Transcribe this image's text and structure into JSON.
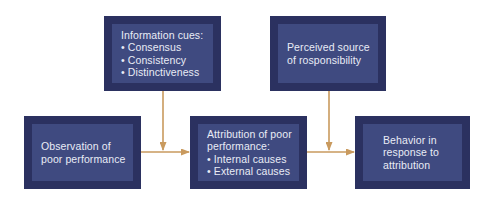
{
  "diagram": {
    "nodes": [
      {
        "id": "information-cues",
        "title": "Information cues:",
        "bullets": [
          "Consensus",
          "Consistency",
          "Distinctiveness"
        ]
      },
      {
        "id": "perceived-source",
        "lines": [
          "Perceived source",
          "of rosponsibility"
        ]
      },
      {
        "id": "observation",
        "lines": [
          "Observation of",
          "poor performance"
        ]
      },
      {
        "id": "attribution",
        "lines": [
          "Attribution of poor",
          "performance:"
        ],
        "bullets": [
          "Internal causes",
          "External causes"
        ]
      },
      {
        "id": "behavior",
        "lines": [
          "Behavior in",
          "response to",
          "attribution"
        ]
      }
    ],
    "edges": [
      {
        "from": "observation",
        "to": "attribution"
      },
      {
        "from": "information-cues",
        "to": "observation-attribution-edge"
      },
      {
        "from": "attribution",
        "to": "behavior"
      },
      {
        "from": "perceived-source",
        "to": "attribution-behavior-edge"
      }
    ],
    "colors": {
      "box_outer": "#2b3160",
      "box_inner": "#3f4a80",
      "text": "#e9ecf6",
      "arrow": "#c99a5e"
    }
  }
}
